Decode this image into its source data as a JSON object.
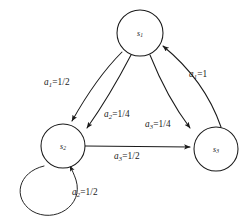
{
  "diagram": {
    "type": "state-transition-diagram",
    "background_color": "#ffffff",
    "stroke_color": "#1a1a1a",
    "nodes": [
      {
        "id": "s1",
        "label": "s",
        "subscript": "1",
        "cx": 140,
        "cy": 33,
        "r": 23
      },
      {
        "id": "s2",
        "label": "s",
        "subscript": "2",
        "cx": 63,
        "cy": 146,
        "r": 22
      },
      {
        "id": "s3",
        "label": "s",
        "subscript": "3",
        "cx": 216,
        "cy": 149,
        "r": 22
      }
    ],
    "edges": [
      {
        "id": "e-s1-s2-a1",
        "from": "s1",
        "to": "s2",
        "action": "a",
        "action_subscript": "1",
        "probability": "1/2",
        "label": "a1=1/2",
        "label_x": 44,
        "label_y": 78
      },
      {
        "id": "e-s1-s2-a2",
        "from": "s1",
        "to": "s2",
        "action": "a",
        "action_subscript": "2",
        "probability": "1/4",
        "label": "a2=1/4",
        "label_x": 104,
        "label_y": 110
      },
      {
        "id": "e-s1-s3-a3",
        "from": "s1",
        "to": "s3",
        "action": "a",
        "action_subscript": "3",
        "probability": "1/4",
        "label": "a3=1/4",
        "label_x": 145,
        "label_y": 120
      },
      {
        "id": "e-s3-s1-a1",
        "from": "s3",
        "to": "s1",
        "action": "a",
        "action_subscript": "1",
        "probability": "1",
        "label": "a1=1",
        "label_x": 189,
        "label_y": 70
      },
      {
        "id": "e-s2-s3-a3",
        "from": "s2",
        "to": "s3",
        "action": "a",
        "action_subscript": "3",
        "probability": "1/2",
        "label": "a3=1/2",
        "label_x": 114,
        "label_y": 152
      },
      {
        "id": "e-s2-s2-a2",
        "from": "s2",
        "to": "s2",
        "action": "a",
        "action_subscript": "2",
        "probability": "1/2",
        "label": "a2=1/2",
        "label_x": 72,
        "label_y": 188
      }
    ]
  }
}
